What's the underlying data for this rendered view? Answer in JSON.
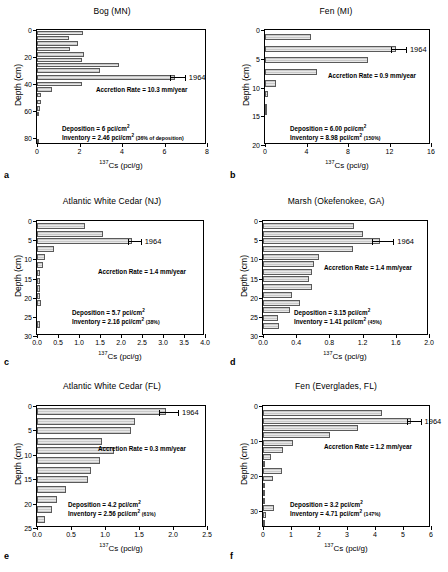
{
  "figure": {
    "xlabel_prefix": "137",
    "xlabel_main": "Cs (pci/g)",
    "ylabel": "Depth (cm)"
  },
  "chart_data": [
    {
      "type": "bar",
      "orientation": "horizontal",
      "panel": "a",
      "title": "Bog (MN)",
      "xlabel": "137Cs (pci/g)",
      "ylabel": "Depth (cm)",
      "xlim": [
        0,
        8
      ],
      "ylim": [
        0,
        85
      ],
      "xticks": [
        "0",
        "2",
        "4",
        "6",
        "8"
      ],
      "xtick_values": [
        0,
        2,
        4,
        6,
        8
      ],
      "yticks": [
        "0",
        "20",
        "40",
        "60",
        "80"
      ],
      "ytick_values": [
        0,
        20,
        40,
        60,
        80
      ],
      "bar_thickness_cm": 3.2,
      "depths": [
        2,
        6,
        10,
        14,
        18,
        22,
        26,
        30,
        35,
        40,
        44,
        48,
        53,
        58,
        62,
        82
      ],
      "values": [
        2.15,
        1.5,
        1.95,
        1.55,
        2.2,
        2.1,
        3.85,
        2.95,
        6.5,
        2.1,
        0.72,
        0.2,
        0.17,
        0.13,
        0.1,
        0.05
      ],
      "marker_1964": {
        "depth": 35,
        "value": 6.5,
        "error": 0.22,
        "label": "1964"
      },
      "accretion_rate": "Accretion Rate = 10.3 mm/year",
      "deposition": "Deposition = 6 pci/cm",
      "deposition_sup": "2",
      "inventory": "Inventory = 2.46 pci/cm",
      "inventory_sup": "2",
      "inventory_pct": "(36% of deposition)"
    },
    {
      "type": "bar",
      "orientation": "horizontal",
      "panel": "b",
      "title": "Fen (MI)",
      "xlabel": "137Cs (pci/g)",
      "ylabel": "Depth (cm)",
      "xlim": [
        0,
        16
      ],
      "ylim": [
        0,
        20
      ],
      "xticks": [
        "0",
        "4",
        "8",
        "12",
        "16"
      ],
      "xtick_values": [
        0,
        4,
        8,
        12,
        16
      ],
      "yticks": [
        "0",
        "5",
        "10",
        "15",
        "20"
      ],
      "ytick_values": [
        0,
        5,
        10,
        15,
        20
      ],
      "bar_thickness_cm": 1.1,
      "depths": [
        1.2,
        3.3,
        5.2,
        7.3,
        9.3,
        11.1,
        13.5,
        14.3
      ],
      "values": [
        4.4,
        12.6,
        9.9,
        5.0,
        1.1,
        0.28,
        0.1,
        0.1
      ],
      "marker_1964": {
        "depth": 3.3,
        "value": 12.6,
        "error": 0.5,
        "label": "1964"
      },
      "accretion_rate": "Accretion Rate = 0.9 mm/year",
      "deposition": "Deposition = 6.00 pci/cm",
      "deposition_sup": "2",
      "inventory": "Inventory = 8.98 pci/cm",
      "inventory_sup": "2",
      "inventory_pct": "(150%)"
    },
    {
      "type": "bar",
      "orientation": "horizontal",
      "panel": "c",
      "title": "Atlantic White Cedar (NJ)",
      "xlabel": "137Cs (pci/g)",
      "ylabel": "Depth (cm)",
      "xlim": [
        0,
        4.0
      ],
      "ylim": [
        0,
        30
      ],
      "xticks": [
        "0.0",
        "0.5",
        "1.0",
        "1.5",
        "2.0",
        "2.5",
        "3.0",
        "3.5",
        "4.0"
      ],
      "xtick_values": [
        0,
        0.5,
        1.0,
        1.5,
        2.0,
        2.5,
        3.0,
        3.5,
        4.0
      ],
      "yticks": [
        "0",
        "5",
        "10",
        "15",
        "20",
        "25",
        "30"
      ],
      "ytick_values": [
        0,
        5,
        10,
        15,
        20,
        25,
        30
      ],
      "bar_thickness_cm": 1.6,
      "depths": [
        1.2,
        3.3,
        5.2,
        7.3,
        9.4,
        11.4,
        13.6,
        15.6,
        17.6,
        19.6,
        21.5,
        27.0
      ],
      "values": [
        1.14,
        1.57,
        2.26,
        0.4,
        0.18,
        0.15,
        0.07,
        0.08,
        0.08,
        0.08,
        0.09,
        0.07
      ],
      "marker_1964": {
        "depth": 5.2,
        "value": 2.26,
        "error": 0.09,
        "label": "1964"
      },
      "accretion_rate": "Accretion Rate = 1.4 mm/year",
      "deposition": "Deposition = 5.7 pci/cm",
      "deposition_sup": "2",
      "inventory": "Inventory = 2.16 pci/cm",
      "inventory_sup": "2",
      "inventory_pct": "(38%)"
    },
    {
      "type": "bar",
      "orientation": "horizontal",
      "panel": "d",
      "title": "Marsh  (Okefenokee, GA)",
      "xlabel": "137Cs (pci/g)",
      "ylabel": "Depth (cm)",
      "xlim": [
        0,
        2.0
      ],
      "ylim": [
        0,
        30
      ],
      "xticks": [
        "0.0",
        "0.4",
        "0.8",
        "1.2",
        "1.6",
        "2.0"
      ],
      "xtick_values": [
        0,
        0.4,
        0.8,
        1.2,
        1.6,
        2.0
      ],
      "yticks": [
        "0",
        "5",
        "10",
        "15",
        "20",
        "25",
        "30"
      ],
      "ytick_values": [
        0,
        5,
        10,
        15,
        20,
        25,
        30
      ],
      "bar_thickness_cm": 1.6,
      "depths": [
        1.3,
        3.3,
        5.2,
        7.3,
        9.3,
        11.3,
        13.2,
        15.2,
        17.2,
        19.3,
        21.3,
        23.3,
        25.3,
        27.4
      ],
      "values": [
        1.1,
        1.21,
        1.41,
        1.08,
        0.67,
        0.62,
        0.59,
        0.56,
        0.59,
        0.35,
        0.44,
        0.33,
        0.18,
        0.19
      ],
      "marker_1964": {
        "depth": 5.2,
        "value": 1.41,
        "error": 0.1,
        "label": "1964"
      },
      "accretion_rate": "Accretion Rate = 1.4 mm/year",
      "deposition": "Deposition = 3.15 pci/cm",
      "deposition_sup": "2",
      "inventory": "Inventory = 1.41 pci/cm",
      "inventory_sup": "2",
      "inventory_pct": "(45%)"
    },
    {
      "type": "bar",
      "orientation": "horizontal",
      "panel": "e",
      "title": "Atlantic White Cedar (FL)",
      "xlabel": "137Cs (pci/g)",
      "ylabel": "Depth (cm)",
      "xlim": [
        0,
        2.5
      ],
      "ylim": [
        0,
        25
      ],
      "xticks": [
        "0.0",
        "0.5",
        "1.0",
        "1.5",
        "2.0",
        "2.5"
      ],
      "xtick_values": [
        0,
        0.5,
        1.0,
        1.5,
        2.0,
        2.5
      ],
      "yticks": [
        "0",
        "5",
        "10",
        "15",
        "20",
        "25"
      ],
      "ytick_values": [
        0,
        5,
        10,
        15,
        20,
        25
      ],
      "bar_thickness_cm": 1.4,
      "depths": [
        1.2,
        3.1,
        5.0,
        7.2,
        9.2,
        11.2,
        13.2,
        15.1,
        17.1,
        19.2,
        21.2,
        23.3
      ],
      "values": [
        1.9,
        1.44,
        1.38,
        0.95,
        1.13,
        0.93,
        0.79,
        0.75,
        0.42,
        0.29,
        0.22,
        0.12
      ],
      "marker_1964": {
        "depth": 1.2,
        "value": 1.9,
        "error": 0.1,
        "label": "1964"
      },
      "accretion_rate": "Accretion Rate = 0.3 mm/year",
      "deposition": "Deposition = 4.2 pci/cm",
      "deposition_sup": "2",
      "inventory": "Inventory = 2.56 pci/cm",
      "inventory_sup": "2",
      "inventory_pct": "(61%)"
    },
    {
      "type": "bar",
      "orientation": "horizontal",
      "panel": "f",
      "title": "Fen (Everglades, FL)",
      "xlabel": "137Cs (pci/g)",
      "ylabel": "Depth (cm)",
      "xlim": [
        0,
        6
      ],
      "ylim": [
        0,
        35
      ],
      "xticks": [
        "0",
        "1",
        "2",
        "3",
        "4",
        "5",
        "6"
      ],
      "xtick_values": [
        0,
        1,
        2,
        3,
        4,
        5,
        6
      ],
      "yticks": [
        "0",
        "10",
        "20",
        "30"
      ],
      "ytick_values": [
        0,
        10,
        20,
        30
      ],
      "bar_thickness_cm": 1.7,
      "depths": [
        2.0,
        4.2,
        6.3,
        8.4,
        10.5,
        12.6,
        14.6,
        16.6,
        18.7,
        20.8,
        22.8,
        25.0,
        27.2,
        29.3,
        31.4,
        33.5
      ],
      "values": [
        4.25,
        5.3,
        3.4,
        2.4,
        1.07,
        0.7,
        0.3,
        0.07,
        0.68,
        0.35,
        0.05,
        0.05,
        0.05,
        0.4,
        0.1,
        0.08
      ],
      "marker_1964": {
        "depth": 4.2,
        "value": 5.3,
        "error": 0.15,
        "label": "1964"
      },
      "accretion_rate": "Accretion Rate = 1.2 mm/year",
      "deposition": "Deposition = 3.2 pci/cm",
      "deposition_sup": "2",
      "inventory": "Inventory = 4.71 pci/cm",
      "inventory_sup": "2",
      "inventory_pct": "(147%)"
    }
  ],
  "panel_letters": [
    "a",
    "b",
    "c",
    "d",
    "e",
    "f"
  ]
}
